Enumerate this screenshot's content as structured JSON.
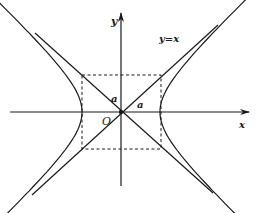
{
  "figure": {
    "type": "hyperbola-with-asymptotes",
    "labels": {
      "x_axis": "x",
      "y_axis": "y",
      "origin": "O",
      "asymptote": "y=x",
      "semi_axis_horizontal": "a",
      "semi_axis_diagonal": "a"
    },
    "colors": {
      "stroke": "#1a1a1a",
      "background": "#ffffff"
    },
    "geometry": {
      "origin_px": [
        121,
        112
      ],
      "a_px": 39,
      "b_px": 37,
      "rectangle": {
        "left": 82,
        "right": 161,
        "top": 75,
        "bottom": 149,
        "style": "dashed"
      }
    }
  }
}
